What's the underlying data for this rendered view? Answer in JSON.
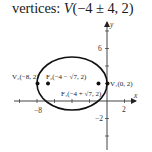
{
  "title": {
    "prefix": "vertices: ",
    "var": "V",
    "expr": "(−4  ±  4, 2)"
  },
  "axes": {
    "x_label": "x",
    "y_label": "y",
    "x_ticks": [
      "−8",
      "2"
    ],
    "y_ticks": [
      "6",
      "−2"
    ]
  },
  "ellipse": {
    "center": [
      -4,
      2
    ],
    "a": 4,
    "b": 3
  },
  "points": {
    "v2": {
      "label": "V₂(−8, 2)",
      "coords": [
        -8,
        2
      ]
    },
    "f2": {
      "label": "F₂(−4 − √7, 2)",
      "coords": [
        -6.65,
        2
      ]
    },
    "f1": {
      "label": "F₁(−4 + √7, 2)",
      "coords": [
        -1.35,
        2
      ]
    },
    "v1": {
      "label": "V₁(0, 2)",
      "coords": [
        0,
        2
      ]
    }
  },
  "colors": {
    "ink": "#1a1a1a",
    "axis": "#444444"
  }
}
